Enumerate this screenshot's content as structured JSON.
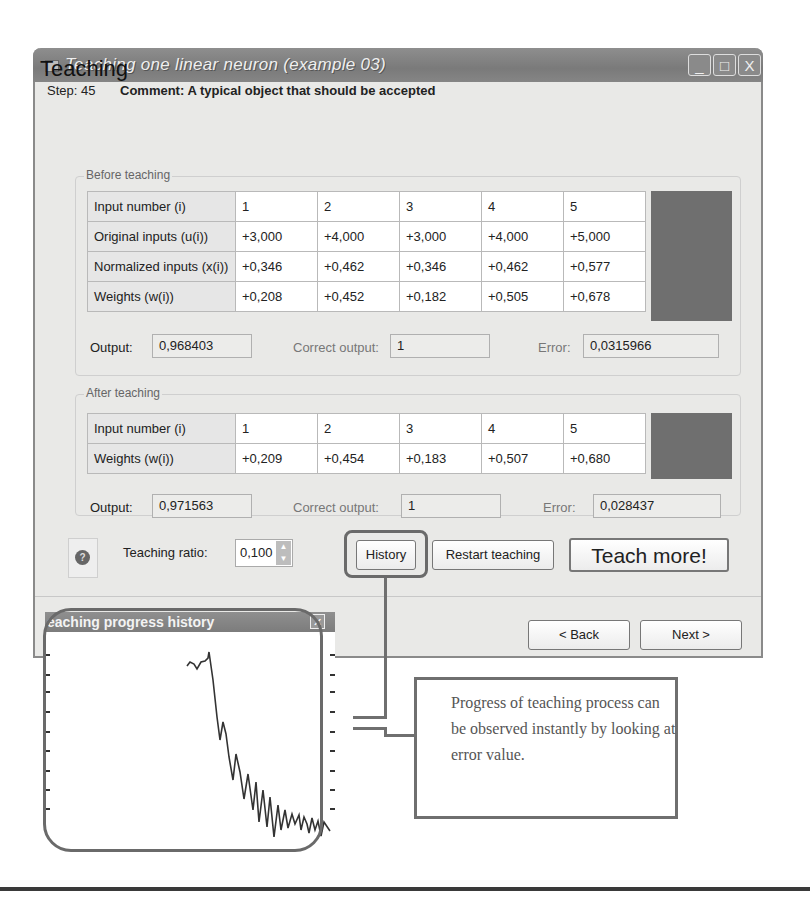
{
  "window": {
    "title": "Teaching one linear neuron (example 03)",
    "controls": {
      "minimize": "_",
      "maximize": "□",
      "close": "X"
    }
  },
  "header": {
    "title": "Teaching",
    "step": "Step: 45",
    "comment": "Comment: A typical object that should be accepted"
  },
  "before": {
    "legend": "Before teaching",
    "rows": [
      {
        "label": "Input number (i)",
        "values": [
          "1",
          "2",
          "3",
          "4",
          "5"
        ]
      },
      {
        "label": "Original inputs (u(i))",
        "values": [
          "+3,000",
          "+4,000",
          "+3,000",
          "+4,000",
          "+5,000"
        ]
      },
      {
        "label": "Normalized inputs (x(i))",
        "values": [
          "+0,346",
          "+0,462",
          "+0,346",
          "+0,462",
          "+0,577"
        ]
      },
      {
        "label": "Weights (w(i))",
        "values": [
          "+0,208",
          "+0,452",
          "+0,182",
          "+0,505",
          "+0,678"
        ]
      }
    ],
    "output_label": "Output:",
    "output_value": "0,968403",
    "correct_label": "Correct output:",
    "correct_value": "1",
    "error_label": "Error:",
    "error_value": "0,0315966"
  },
  "after": {
    "legend": "After teaching",
    "rows": [
      {
        "label": "Input number (i)",
        "values": [
          "1",
          "2",
          "3",
          "4",
          "5"
        ]
      },
      {
        "label": "Weights (w(i))",
        "values": [
          "+0,209",
          "+0,454",
          "+0,183",
          "+0,507",
          "+0,680"
        ]
      }
    ],
    "output_label": "Output:",
    "output_value": "0,971563",
    "correct_label": "Correct output:",
    "correct_value": "1",
    "error_label": "Error:",
    "error_value": "0,028437"
  },
  "controls": {
    "help_icon": "?",
    "ratio_label": "Teaching ratio:",
    "ratio_value": "0,100",
    "history": "History",
    "restart": "Restart teaching",
    "teach_more": "Teach more!",
    "back": "< Back",
    "next": "Next >"
  },
  "history_popup": {
    "title": "eaching progress history",
    "close": "✕"
  },
  "callout": {
    "text": "Progress of teaching process can be observed instantly by looking at error value."
  },
  "colors": {
    "titlebar": "#7f7f7f",
    "window_bg": "#e9e9e7",
    "dark_block": "#6f6f6f",
    "annotation": "#6a6a6a"
  }
}
